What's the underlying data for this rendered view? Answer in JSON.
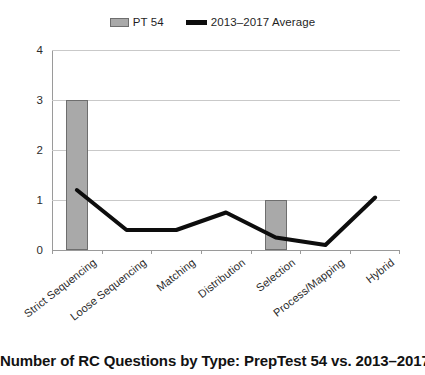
{
  "chart_data": {
    "type": "bar",
    "title": "Number of RC Questions by Type: PrepTest 54 vs. 2013–2017 Average",
    "xlabel": "",
    "ylabel": "",
    "ylim": [
      0,
      4
    ],
    "yticks": [
      0,
      1,
      2,
      3,
      4
    ],
    "ytick_labels": [
      "0",
      "1",
      "2",
      "3",
      "4"
    ],
    "grid": true,
    "legend_position": "top-center",
    "categories": [
      "Strict Sequencing",
      "Loose Sequencing",
      "Matching",
      "Distribution",
      "Selection",
      "Process/Mapping",
      "Hybrid"
    ],
    "series": [
      {
        "name": "PT 54",
        "type": "bar",
        "color": "#a9a9a9",
        "border_color": "#6e6e6e",
        "values": [
          3,
          0,
          0,
          0,
          1,
          0,
          0
        ]
      },
      {
        "name": "2013–2017 Average",
        "type": "line",
        "color": "#0d0d0d",
        "values": [
          1.2,
          0.4,
          0.4,
          0.75,
          0.25,
          0.1,
          1.05
        ]
      }
    ]
  },
  "legend": {
    "entries": [
      {
        "label": "PT 54",
        "marker": "bar-swatch"
      },
      {
        "label": "2013–2017 Average",
        "marker": "line-swatch"
      }
    ]
  },
  "axis": {
    "y_tick_labels": [
      "4",
      "3",
      "2",
      "1",
      "0"
    ]
  }
}
